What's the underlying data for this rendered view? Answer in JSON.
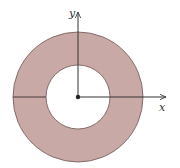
{
  "diagram": {
    "type": "annulus",
    "center": [
      78,
      97
    ],
    "outer_radius": 65,
    "inner_radius": 32,
    "colors": {
      "fill": "#c9a9a6",
      "stroke": "#6b5553",
      "axis": "#333333",
      "background": "#ffffff"
    },
    "labels": {
      "x_axis": "x",
      "y_axis": "y"
    }
  }
}
